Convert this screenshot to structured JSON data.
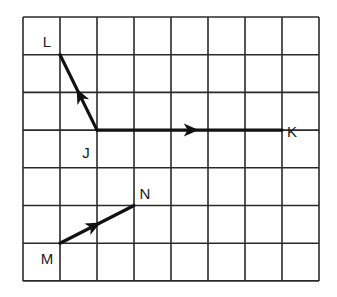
{
  "figure": {
    "grid": {
      "columns": 8,
      "rows": 7,
      "origin_px": [
        23,
        17
      ],
      "cell_px": [
        37,
        37.7
      ],
      "line_color": "#2a2a2a",
      "background": "#ffffff"
    },
    "colors": {
      "vector": "#111111",
      "grid": "#2a2a2a",
      "label": "#1a1a1a"
    },
    "points": [
      {
        "id": "L",
        "label": "L",
        "grid": [
          1,
          1
        ],
        "label_px": [
          47,
          47
        ]
      },
      {
        "id": "J",
        "label": "J",
        "grid": [
          2,
          3
        ],
        "label_px": [
          86,
          158
        ]
      },
      {
        "id": "K",
        "label": "K",
        "grid": [
          7,
          3
        ],
        "label_px": [
          292,
          137
        ]
      },
      {
        "id": "M",
        "label": "M",
        "grid": [
          1,
          6
        ],
        "label_px": [
          47,
          264
        ]
      },
      {
        "id": "N",
        "label": "N",
        "grid": [
          3,
          5
        ],
        "label_px": [
          145,
          199
        ]
      }
    ],
    "vectors": [
      {
        "id": "JL",
        "from": "J",
        "to": "L",
        "name": "vector-JL"
      },
      {
        "id": "JK",
        "from": "J",
        "to": "K",
        "name": "vector-JK"
      },
      {
        "id": "MN",
        "from": "M",
        "to": "N",
        "name": "vector-MN"
      }
    ]
  },
  "labels": {
    "L": "L",
    "J": "J",
    "K": "K",
    "M": "M",
    "N": "N"
  }
}
